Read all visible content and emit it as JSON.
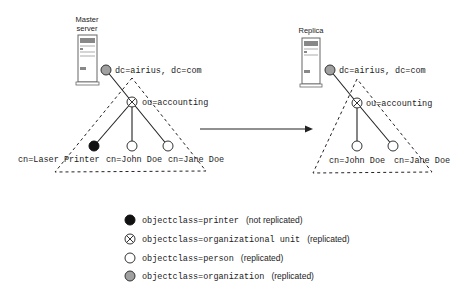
{
  "diagram": {
    "colors": {
      "printer": "#111111",
      "organization": "#a0a0a0",
      "person": "#ffffff",
      "line": "#222222"
    },
    "master": {
      "server_label_line1": "Master",
      "server_label_line2": "server",
      "root_label": "dc=airius, dc=com",
      "ou_label": "ou=accounting",
      "leaves": [
        {
          "label": "cn=Laser Printer",
          "type": "printer"
        },
        {
          "label": "cn=John Doe",
          "type": "person"
        },
        {
          "label": "cn=Jane Doe",
          "type": "person"
        }
      ]
    },
    "replica": {
      "server_label": "Replica",
      "root_label": "dc=airius, dc=com",
      "ou_label": "ou=accounting",
      "leaves": [
        {
          "label": "cn=John Doe",
          "type": "person"
        },
        {
          "label": "cn=Jane Doe",
          "type": "person"
        }
      ]
    },
    "legend": [
      {
        "icon": "filled-black-circle",
        "code": "objectclass=printer",
        "note": "(not replicated)"
      },
      {
        "icon": "crossed-circle",
        "code": "objectclass=organizational unit",
        "note": "(replicated)"
      },
      {
        "icon": "open-circle",
        "code": "objectclass=person",
        "note": "(replicated)"
      },
      {
        "icon": "gray-circle",
        "code": "objectclass=organization",
        "note": "(replicated)"
      }
    ]
  }
}
